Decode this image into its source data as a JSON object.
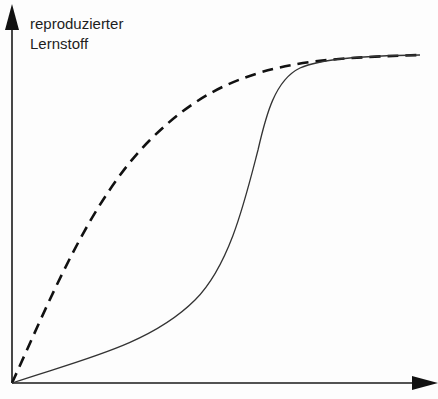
{
  "diagram": {
    "y_axis_label_line1": "reproduzierter",
    "y_axis_label_line2": "Lernstoff",
    "x_axis_label": "",
    "colors": {
      "axis": "#1a1a1a",
      "dashed_curve": "#111111",
      "solid_curve": "#333333",
      "label": "#1e1e1e"
    },
    "curves": [
      {
        "name": "dashed-curve",
        "style": "dashed",
        "description": "concave rise from origin, saturating early"
      },
      {
        "name": "solid-curve",
        "style": "solid",
        "description": "slow start, steep rise, then merges with dashed curve at plateau"
      }
    ]
  }
}
